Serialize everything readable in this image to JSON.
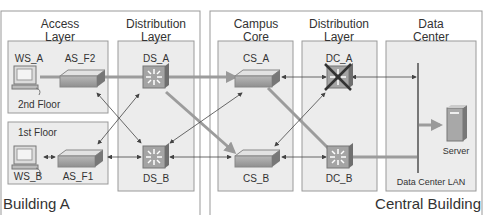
{
  "buildings": [
    {
      "id": "building-a",
      "label": "Building A"
    },
    {
      "id": "central-building",
      "label": "Central Building"
    }
  ],
  "layers": {
    "access": [
      "Access",
      "Layer"
    ],
    "distribution_a": [
      "Distribution",
      "Layer"
    ],
    "campus_core": [
      "Campus",
      "Core"
    ],
    "distribution_c": [
      "Distribution",
      "Layer"
    ],
    "data_center": [
      "Data",
      "Center"
    ]
  },
  "floors": {
    "second": "2nd Floor",
    "first": "1st Floor"
  },
  "devices": {
    "ws_a": "WS_A",
    "ws_b": "WS_B",
    "as_f2": "AS_F2",
    "as_f1": "AS_F1",
    "ds_a": "DS_A",
    "ds_b": "DS_B",
    "cs_a": "CS_A",
    "cs_b": "CS_B",
    "dc_a": "DC_A",
    "dc_b": "DC_B",
    "server": "Server",
    "dc_lan": "Data Center LAN"
  },
  "status": {
    "dc_a": "failed"
  },
  "colors": {
    "box_fill": "#ececec",
    "box_stroke": "#9a9a9a",
    "switch_face": "#a9a9a9",
    "thick_link": "#9c9c9c",
    "thin_link": "#444444"
  }
}
